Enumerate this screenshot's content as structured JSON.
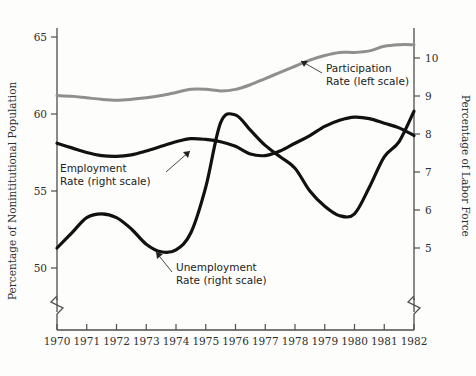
{
  "chart_data": {
    "type": "line",
    "title": "",
    "xlabel": "",
    "ylabel": "Percentage of Nonintitutional Population",
    "y2label": "Percentage of Labor Force",
    "grid": false,
    "legend": "inline-annotations",
    "xlim": [
      1970,
      1982
    ],
    "ylim": [
      48.5,
      65.8
    ],
    "y2lim": [
      4.3,
      10.5
    ],
    "xticks": [
      "1970",
      "1971",
      "1972",
      "1973",
      "1974",
      "1975",
      "1976",
      "1977",
      "1978",
      "1979",
      "1980",
      "1981",
      "1982"
    ],
    "yticks": [
      "50",
      "55",
      "60",
      "65"
    ],
    "y2ticks": [
      "5",
      "6",
      "7",
      "8",
      "9",
      "10"
    ],
    "axis_break_left": true,
    "axis_break_right": true,
    "x": [
      1970,
      1970.5,
      1971,
      1971.5,
      1972,
      1972.5,
      1973,
      1973.5,
      1974,
      1974.5,
      1975,
      1975.5,
      1976,
      1976.5,
      1977,
      1977.5,
      1978,
      1978.5,
      1979,
      1979.5,
      1980,
      1980.5,
      1981,
      1981.5,
      1982
    ],
    "series": [
      {
        "name": "Participation Rate (left scale)",
        "axis": "left",
        "color": "#8f8f8f",
        "values": [
          61.2,
          61.15,
          61.05,
          60.95,
          60.9,
          60.95,
          61.05,
          61.2,
          61.4,
          61.6,
          61.6,
          61.5,
          61.6,
          61.9,
          62.3,
          62.7,
          63.1,
          63.5,
          63.8,
          64.0,
          64.0,
          64.1,
          64.4,
          64.5,
          64.5
        ]
      },
      {
        "name": "Employment Rate (left scale)",
        "axis": "left",
        "color": "#111111",
        "values": [
          58.1,
          57.8,
          57.5,
          57.3,
          57.25,
          57.35,
          57.6,
          57.9,
          58.2,
          58.4,
          58.35,
          58.2,
          57.9,
          57.4,
          57.3,
          57.6,
          58.1,
          58.6,
          59.2,
          59.6,
          59.8,
          59.7,
          59.4,
          59.1,
          58.6
        ]
      },
      {
        "name": "Unemployment Rate (right scale)",
        "axis": "right",
        "color": "#111111",
        "values": [
          5.0,
          5.4,
          5.8,
          5.9,
          5.8,
          5.5,
          5.1,
          4.9,
          4.95,
          5.4,
          6.6,
          8.3,
          8.5,
          8.1,
          7.7,
          7.4,
          7.1,
          6.5,
          6.1,
          5.85,
          5.9,
          6.6,
          7.4,
          7.8,
          8.6
        ]
      }
    ],
    "annotations": [
      {
        "name": "participation-rate-label",
        "line1": "Participation",
        "line2": "Rate (left scale)"
      },
      {
        "name": "employment-rate-label",
        "line1": "Employment",
        "line2": "Rate (left scale)"
      },
      {
        "name": "unemployment-rate-label",
        "line1": "Unemployment",
        "line2": "Rate (right scale)"
      }
    ]
  }
}
